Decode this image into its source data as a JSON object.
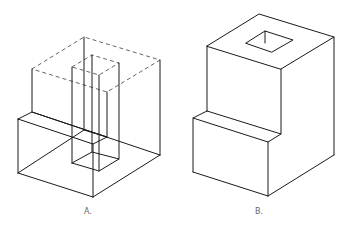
{
  "figures": [
    {
      "id": "A",
      "label": "A.",
      "description": "Wireframe isometric view with hidden edges dashed"
    },
    {
      "id": "B",
      "label": "B.",
      "description": "Solid isometric view of stepped block with square hole"
    }
  ],
  "colors": {
    "line": "#1a1a1a",
    "hidden_line": "#555555",
    "label": "#666666",
    "background": "#ffffff"
  }
}
